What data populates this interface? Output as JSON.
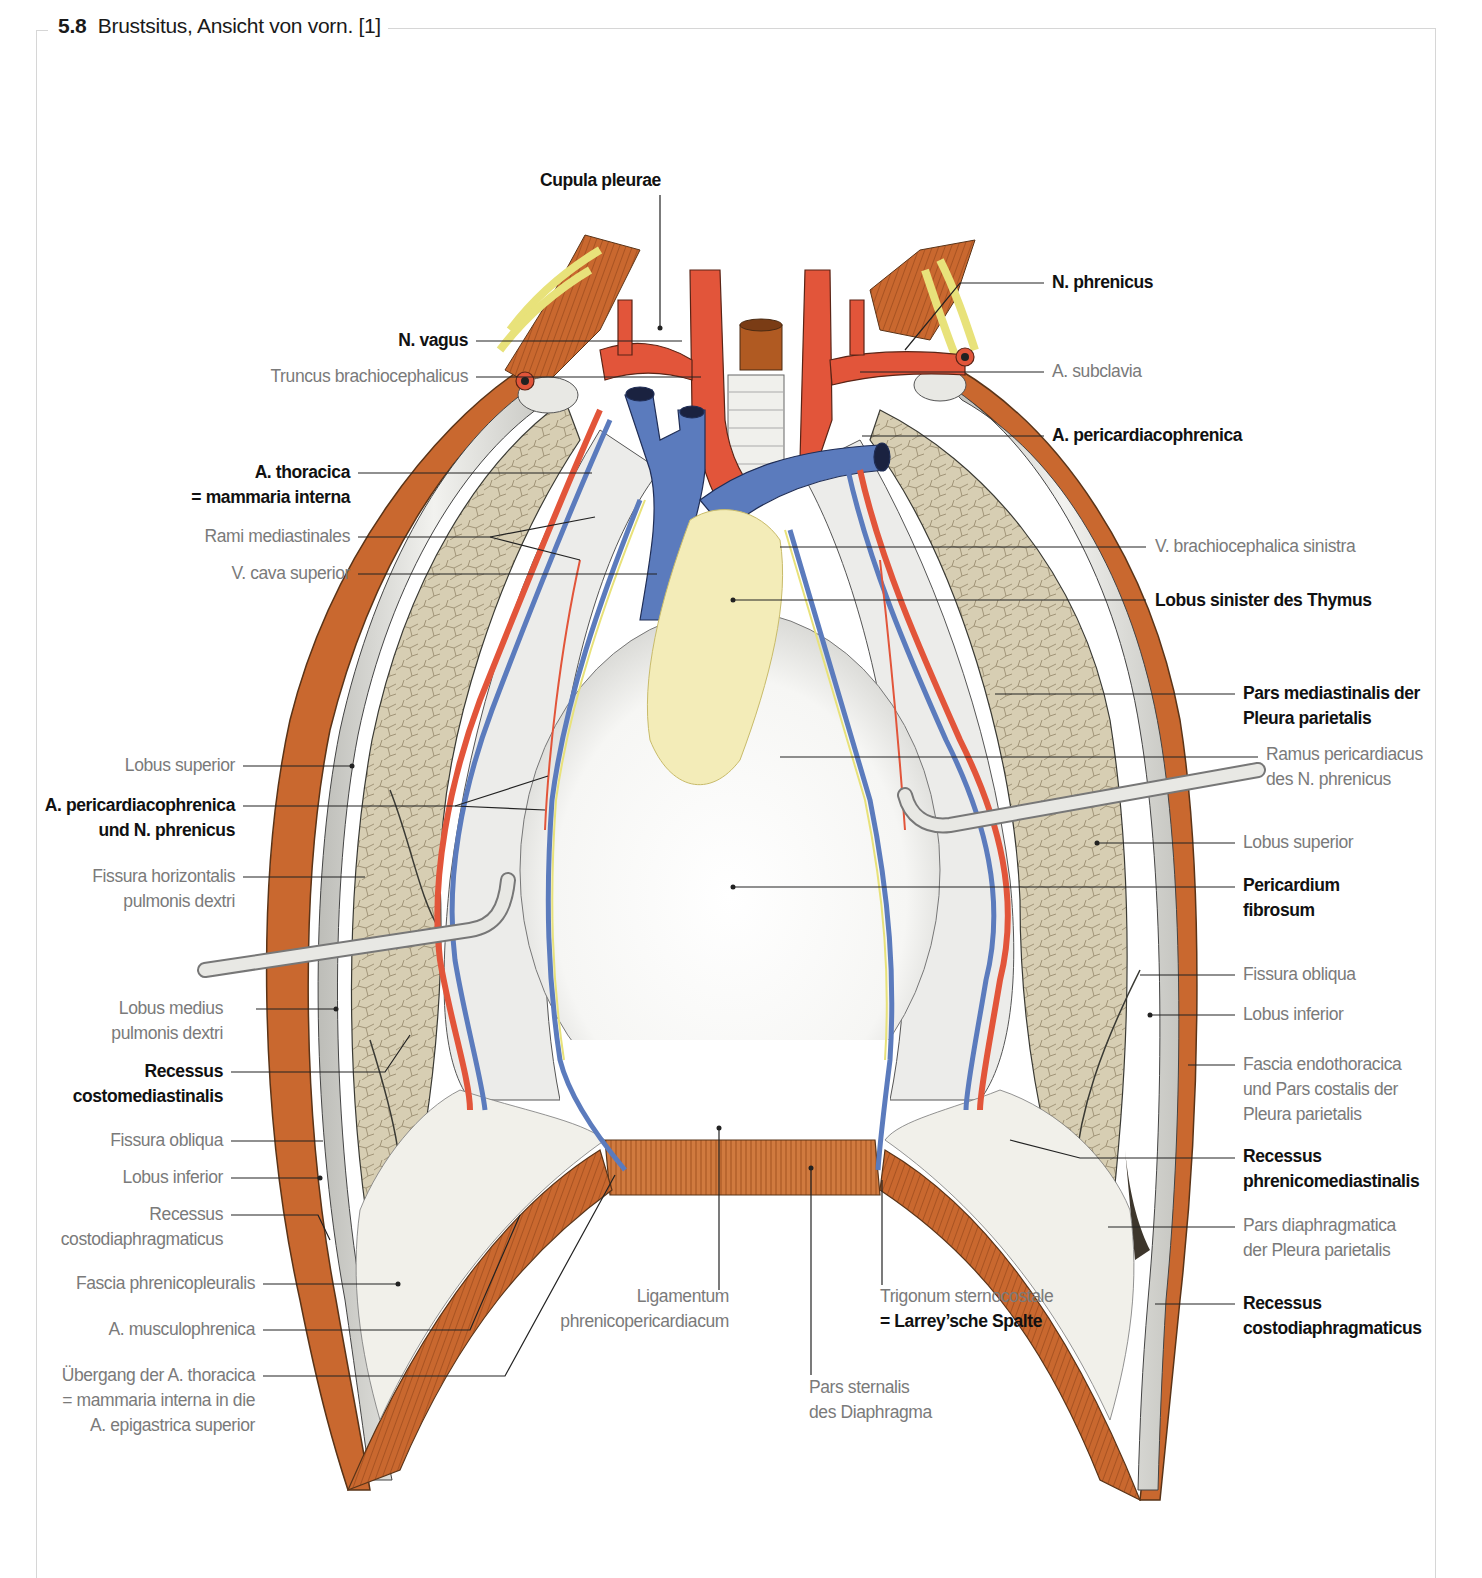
{
  "figure": {
    "number": "5.8",
    "title": "Brustsitus, Ansicht von vorn. [1]"
  },
  "colors": {
    "artery": "#e2553a",
    "vein": "#5b7bbd",
    "nerve": "#e8e27a",
    "muscle": "#c8652c",
    "lung": "#d9cfb4",
    "pleura": "#e9e9e6",
    "thymus": "#f3ecb8",
    "frame": "#d6d6d6",
    "label_bold": "#111111",
    "label_light": "#7a7a7a"
  },
  "labels": {
    "top": {
      "cupula_pleurae": [
        "Cupula pleurae"
      ]
    },
    "left": {
      "n_vagus": [
        "N. vagus"
      ],
      "truncus_brachiocephalicus": [
        "Truncus brachiocephalicus"
      ],
      "a_thoracica": [
        "A. thoracica",
        "= mammaria interna"
      ],
      "rami_mediastinales": [
        "Rami mediastinales"
      ],
      "v_cava_superior": [
        "V. cava superior"
      ],
      "lobus_superior": [
        "Lobus superior"
      ],
      "a_pericardiacophrenica_n_phrenicus": [
        "A. pericardiacophrenica",
        "und N. phrenicus"
      ],
      "fissura_horizontalis": [
        "Fissura horizontalis",
        "pulmonis dextri"
      ],
      "lobus_medius": [
        "Lobus medius",
        "pulmonis dextri"
      ],
      "recessus_costomediastinalis": [
        "Recessus",
        "costomediastinalis"
      ],
      "fissura_obliqua": [
        "Fissura obliqua"
      ],
      "lobus_inferior": [
        "Lobus inferior"
      ],
      "recessus_costodiaphragmaticus": [
        "Recessus",
        "costodiaphragmaticus"
      ],
      "fascia_phrenicopleuralis": [
        "Fascia phrenicopleuralis"
      ],
      "a_musculophrenica": [
        "A. musculophrenica"
      ],
      "uebergang": [
        "Übergang der A. thoracica",
        "= mammaria interna in die",
        "A. epigastrica superior"
      ]
    },
    "bottom": {
      "ligamentum": [
        "Ligamentum",
        "phrenicopericardiacum"
      ],
      "pars_sternalis": [
        "Pars sternalis",
        "des Diaphragma"
      ],
      "trigonum_1": "Trigonum sternocostale",
      "trigonum_2": "= Larrey’sche Spalte"
    },
    "right": {
      "n_phrenicus": [
        "N. phrenicus"
      ],
      "a_subclavia": [
        "A. subclavia"
      ],
      "a_pericardiacophrenica": [
        "A. pericardiacophrenica"
      ],
      "v_brachiocephalica_sinistra": [
        "V. brachiocephalica sinistra"
      ],
      "lobus_sinister_thymus": [
        "Lobus sinister des Thymus"
      ],
      "pars_mediastinalis": [
        "Pars mediastinalis der",
        "Pleura parietalis"
      ],
      "ramus_pericardiacus": [
        "Ramus pericardiacus",
        "des N. phrenicus"
      ],
      "lobus_superior": [
        "Lobus superior"
      ],
      "pericardium_fibrosum": [
        "Pericardium",
        "fibrosum"
      ],
      "fissura_obliqua": [
        "Fissura obliqua"
      ],
      "lobus_inferior": [
        "Lobus inferior"
      ],
      "fascia_endothoracica": [
        "Fascia endothoracica",
        "und Pars costalis der",
        "Pleura parietalis"
      ],
      "recessus_phrenicomediastinalis": [
        "Recessus",
        "phrenicomediastinalis"
      ],
      "pars_diaphragmatica": [
        "Pars diaphragmatica",
        "der Pleura parietalis"
      ],
      "recessus_costodiaphragmaticus": [
        "Recessus",
        "costodiaphragmaticus"
      ]
    }
  }
}
